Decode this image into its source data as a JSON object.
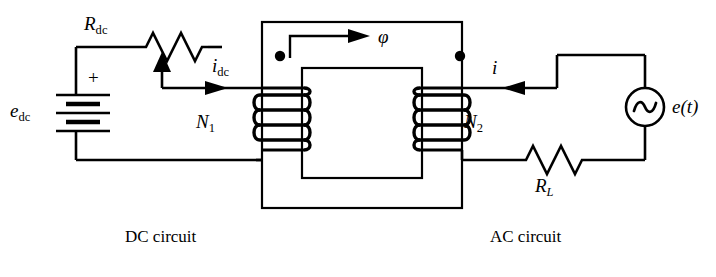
{
  "figure": {
    "type": "transformer-circuit-schematic",
    "background_color": "#ffffff",
    "line_color": "#000000",
    "width": 716,
    "height": 277
  },
  "labels": {
    "r_dc": "R",
    "r_dc_sub": "dc",
    "e_dc": "e",
    "e_dc_sub": "dc",
    "i_dc": "i",
    "i_dc_sub": "dc",
    "polarity_plus": "+",
    "n1": "N",
    "n1_sub": "1",
    "n2": "N",
    "n2_sub": "2",
    "flux": "φ",
    "i_ac": "i",
    "e_t": "e(t)",
    "r_load": "R",
    "r_load_sub": "L",
    "caption_left": "DC circuit",
    "caption_right": "AC circuit"
  },
  "components": {
    "battery": {
      "name": "dc-voltage-source",
      "label": "e_dc",
      "polarity": "+ at top",
      "cells": 3
    },
    "rheostat": {
      "name": "variable-resistor",
      "label": "R_dc",
      "zigzags": 3,
      "has_wiper_arrow": true
    },
    "primary_winding": {
      "name": "primary-winding",
      "label": "N_1",
      "turns": 4,
      "dot_polarity": "top"
    },
    "secondary_winding": {
      "name": "secondary-winding",
      "label": "N_2",
      "turns": 4,
      "dot_polarity": "top"
    },
    "core": {
      "name": "magnetic-core",
      "shape": "rectangular-window",
      "flux_label": "φ",
      "flux_direction": "clockwise-top-rightward"
    },
    "ac_source": {
      "name": "ac-voltage-source",
      "label": "e(t)",
      "symbol": "sine-in-circle"
    },
    "load_resistor": {
      "name": "load-resistor",
      "label": "R_L",
      "zigzags": 3
    },
    "current_arrows": [
      {
        "name": "dc-current-arrow",
        "label": "i_dc",
        "direction": "right"
      },
      {
        "name": "ac-current-arrow",
        "label": "i",
        "direction": "left"
      }
    ]
  }
}
